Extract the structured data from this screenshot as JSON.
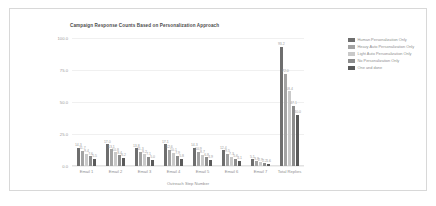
{
  "chart_data": {
    "type": "bar",
    "title": "Campaign Response Counts Based on Personalization Approach",
    "xlabel": "Outreach Step Number",
    "ylabel": "",
    "ylim": [
      0,
      100
    ],
    "grid": true,
    "legend_position": "right",
    "categories": [
      "Email 1",
      "Email 2",
      "Email 3",
      "Email 4",
      "Email 5",
      "Email 6",
      "Email 7",
      "Total Replies"
    ],
    "yticks": [
      "100.0",
      "75.0",
      "50.0",
      "25.0",
      "0.0"
    ],
    "ytick_values": [
      100,
      75,
      50,
      25,
      0
    ],
    "series": [
      {
        "name": "Human Personalization Only",
        "color": "#6e6e6e",
        "values": [
          14.3,
          17.0,
          13.8,
          17.1,
          14.3,
          12.4,
          5.1,
          93.2
        ],
        "labels": [
          "14.3",
          "17.0",
          "13.8",
          "17.1",
          "14.3",
          "12.4",
          "5.1",
          "93.2"
        ]
      },
      {
        "name": "Heavy Auto Personalization Only",
        "color": "#a3a3a3",
        "values": [
          11.7,
          13.1,
          11.3,
          12.6,
          10.9,
          9.5,
          3.8,
          72.0
        ],
        "labels": [
          "11.7",
          "13.1",
          "11.3",
          "12.6",
          "10.9",
          "9.5",
          "3.8",
          "72.0"
        ]
      },
      {
        "name": "Light Auto Personalization Only",
        "color": "#c9c9c9",
        "values": [
          9.4,
          10.8,
          9.2,
          10.1,
          8.7,
          7.3,
          2.9,
          58.4
        ],
        "labels": [
          "9.4",
          "10.8",
          "9.2",
          "10.1",
          "8.7",
          "7.3",
          "2.9",
          "58.4"
        ]
      },
      {
        "name": "No Personalization Only",
        "color": "#8c8c8c",
        "values": [
          7.6,
          8.4,
          7.1,
          7.9,
          6.8,
          5.6,
          2.2,
          47.1
        ],
        "labels": [
          "7.6",
          "8.4",
          "7.1",
          "7.9",
          "6.8",
          "5.6",
          "2.2",
          "47.1"
        ]
      },
      {
        "name": "One and done",
        "color": "#5a5a5a",
        "values": [
          5.5,
          6.2,
          5.0,
          5.8,
          4.9,
          4.1,
          1.6,
          40.0
        ],
        "labels": [
          "5.5",
          "6.2",
          "5.0",
          "5.8",
          "4.9",
          "4.1",
          "1.6",
          "40.0"
        ]
      }
    ]
  }
}
